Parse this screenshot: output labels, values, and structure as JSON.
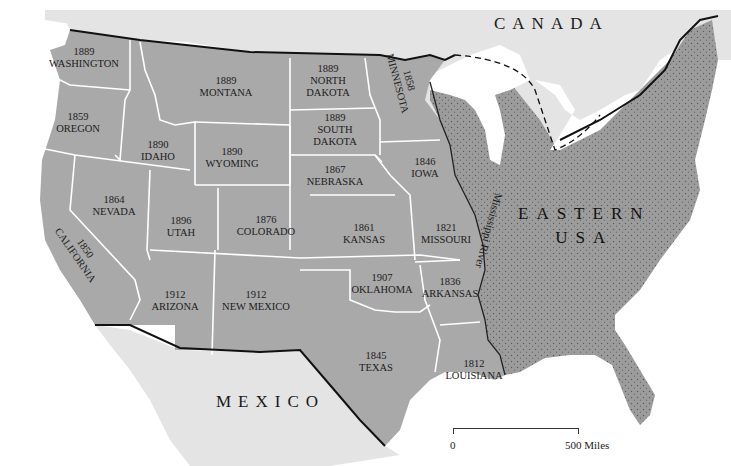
{
  "map": {
    "title": "Admission of Western States",
    "regions": {
      "canada": "CANADA",
      "mexico": "MEXICO",
      "eastern_usa_line1": "EASTERN",
      "eastern_usa_line2": "USA"
    },
    "river_label": "Mississippi River",
    "states": [
      {
        "name": "WASHINGTON",
        "year": "1889"
      },
      {
        "name": "OREGON",
        "year": "1859"
      },
      {
        "name": "CALIFORNIA",
        "year": "1850"
      },
      {
        "name": "IDAHO",
        "year": "1890"
      },
      {
        "name": "NEVADA",
        "year": "1864"
      },
      {
        "name": "MONTANA",
        "year": "1889"
      },
      {
        "name": "WYOMING",
        "year": "1890"
      },
      {
        "name": "UTAH",
        "year": "1896"
      },
      {
        "name": "ARIZONA",
        "year": "1912"
      },
      {
        "name": "COLORADO",
        "year": "1876"
      },
      {
        "name": "NEW MEXICO",
        "year": "1912"
      },
      {
        "name": "NORTH DAKOTA",
        "year": "1889"
      },
      {
        "name": "SOUTH DAKOTA",
        "year": "1889"
      },
      {
        "name": "NEBRASKA",
        "year": "1867"
      },
      {
        "name": "KANSAS",
        "year": "1861"
      },
      {
        "name": "OKLAHOMA",
        "year": "1907"
      },
      {
        "name": "TEXAS",
        "year": "1845"
      },
      {
        "name": "MINNESOTA",
        "year": "1858"
      },
      {
        "name": "IOWA",
        "year": "1846"
      },
      {
        "name": "MISSOURI",
        "year": "1821"
      },
      {
        "name": "ARKANSAS",
        "year": "1836"
      },
      {
        "name": "LOUISIANA",
        "year": "1812"
      }
    ],
    "scale": {
      "start": "0",
      "end": "500 Miles"
    },
    "colors": {
      "western_states": "#a9a9a9",
      "eastern_usa": "#9c9c9c",
      "foreign_land": "#e4e4e4",
      "water": "#ffffff",
      "state_borders": "#ffffff",
      "national_border": "#111111"
    }
  }
}
